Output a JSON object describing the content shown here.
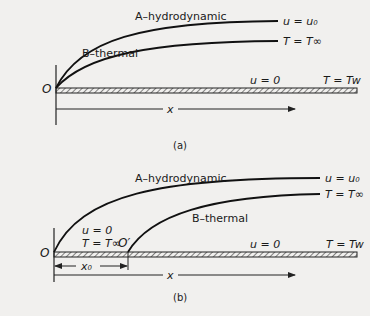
{
  "figure_a": {
    "caption": "(a)",
    "curve_a_label": "A–hydrodynamic",
    "curve_b_label": "B–thermal",
    "free_stream_velocity": "u = u₀",
    "free_stream_temp": "T = T∞",
    "wall_velocity": "u = 0",
    "wall_temp": "T = Tw",
    "origin": "O",
    "x_axis": "x"
  },
  "figure_b": {
    "caption": "(b)",
    "curve_a_label": "A–hydrodynamic",
    "curve_b_label": "B–thermal",
    "free_stream_velocity": "u = u₀",
    "free_stream_temp": "T = T∞",
    "unheated_velocity": "u = 0",
    "unheated_temp": "T = T∞",
    "wall_velocity": "u = 0",
    "wall_temp": "T = Tw",
    "origin": "O",
    "origin_prime": "O′",
    "x0_label": "x₀",
    "x_axis": "x"
  }
}
